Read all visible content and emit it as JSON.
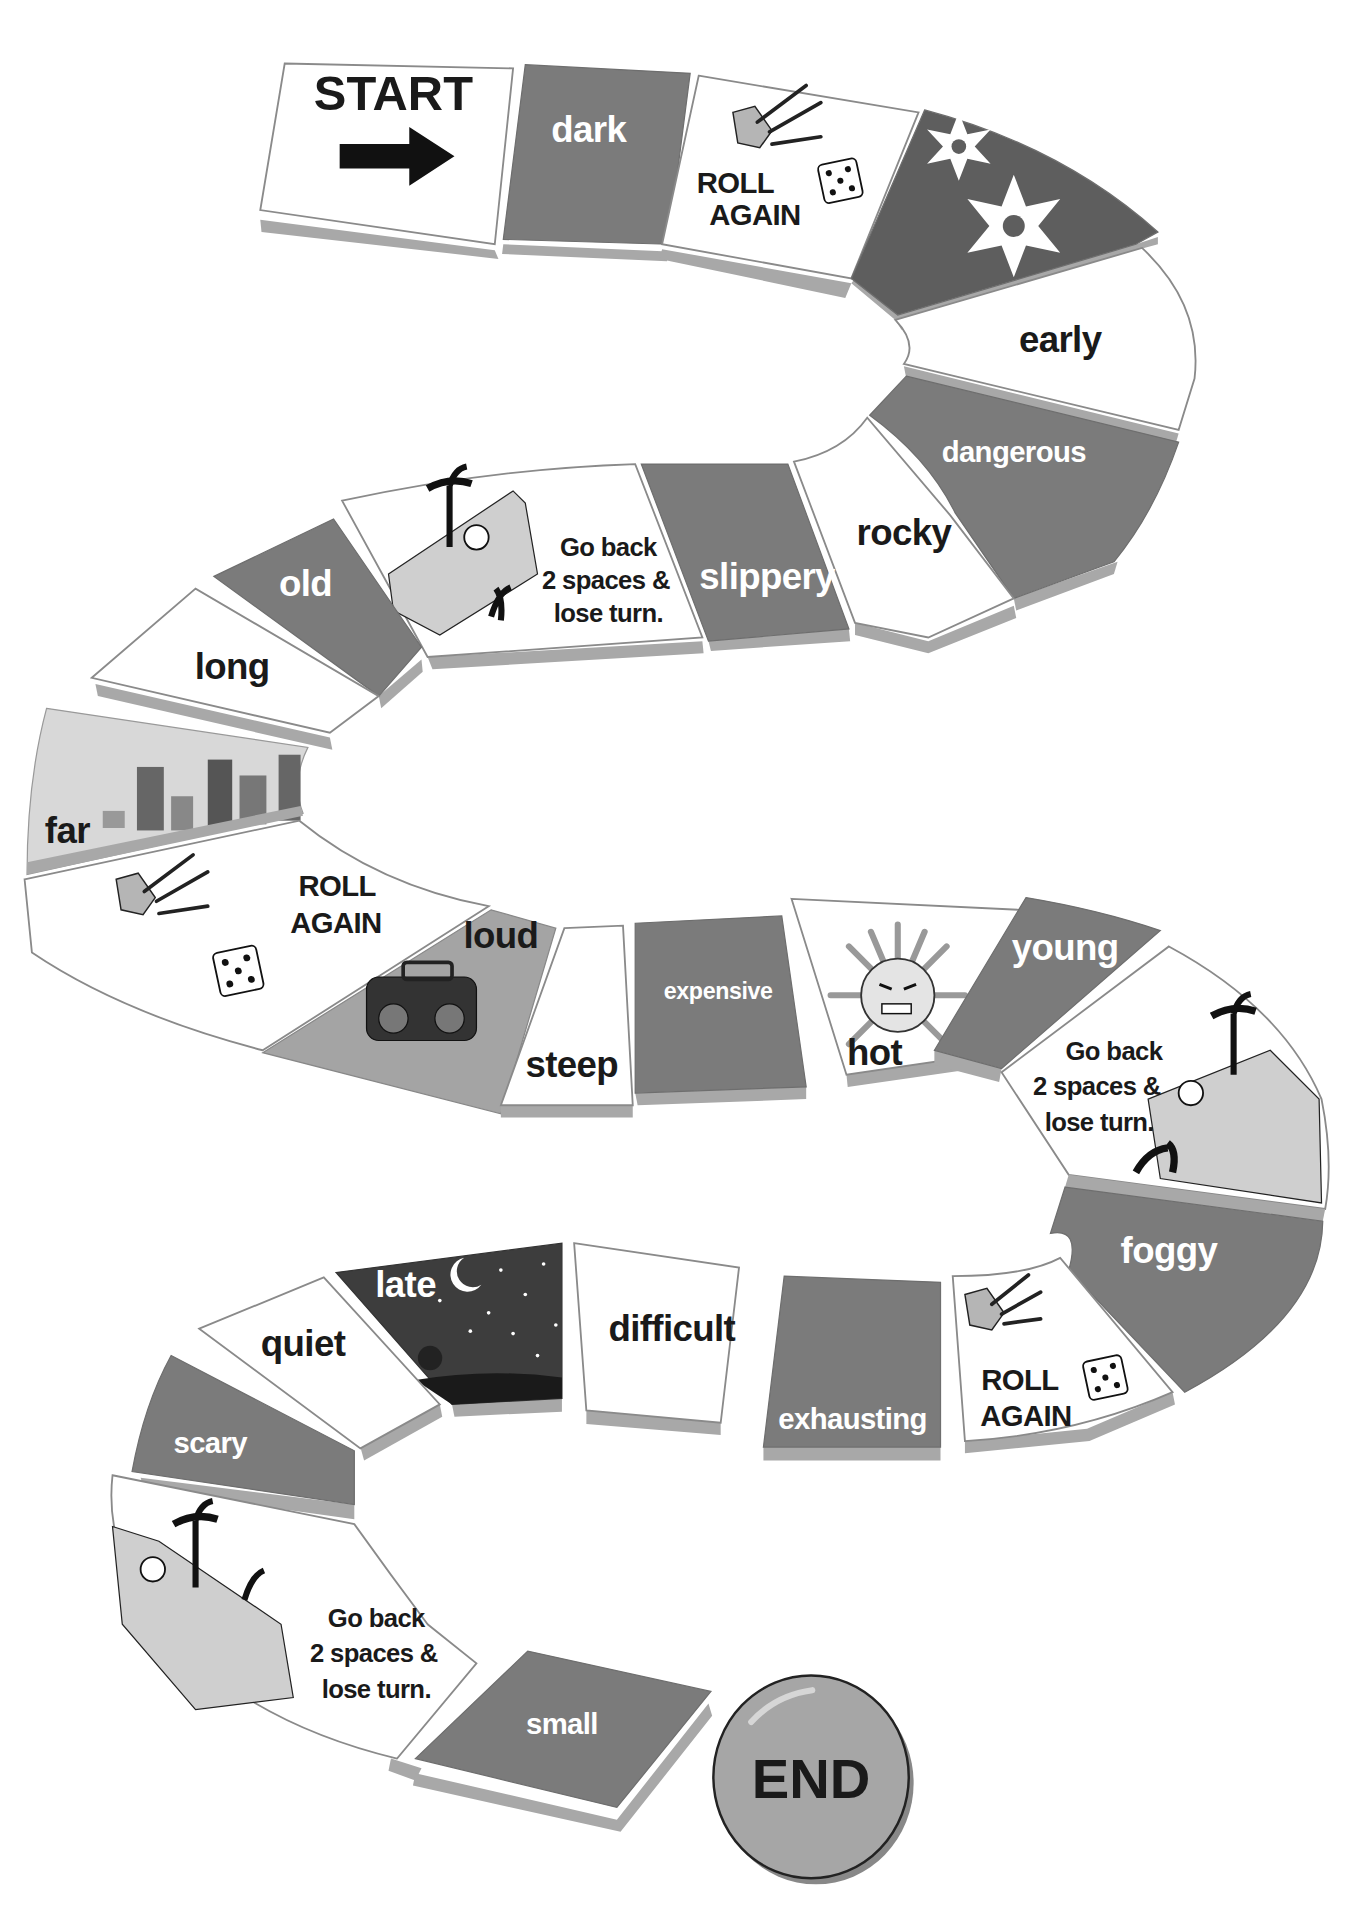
{
  "board": {
    "title": "Adjective board game",
    "colors": {
      "dark_tile": "#7b7b7b",
      "light_tile": "#ffffff",
      "shadow": "#a8a8a8",
      "night_tile": "#3d3d3d",
      "end_button": "#a6a6a6"
    },
    "start": {
      "label": "START",
      "icon": "arrow-right-icon"
    },
    "end": {
      "label": "END"
    },
    "tiles": [
      {
        "label": "dark",
        "style": "dark"
      },
      {
        "line1": "ROLL",
        "line2": "AGAIN",
        "style": "light",
        "icon": "hand-rolling-dice-icon"
      },
      {
        "label": "",
        "style": "dark",
        "icon": "snowflake-icon"
      },
      {
        "label": "early",
        "style": "light"
      },
      {
        "label": "dangerous",
        "style": "dark"
      },
      {
        "label": "rocky",
        "style": "light"
      },
      {
        "label": "slippery",
        "style": "dark"
      },
      {
        "line1": "Go back",
        "line2": "2 spaces &",
        "line3": "lose turn.",
        "style": "light",
        "icon": "falling-explorer-icon"
      },
      {
        "label": "old",
        "style": "dark"
      },
      {
        "label": "long",
        "style": "light"
      },
      {
        "label": "far",
        "style": "sky",
        "icon": "city-skyline-icon"
      },
      {
        "line1": "ROLL",
        "line2": "AGAIN",
        "style": "light",
        "icon": "hand-rolling-dice-icon"
      },
      {
        "label": "loud",
        "style": "loud",
        "icon": "boombox-icon"
      },
      {
        "label": "steep",
        "style": "light"
      },
      {
        "label": "expensive",
        "style": "dark"
      },
      {
        "label": "hot",
        "style": "light",
        "icon": "angry-sun-icon"
      },
      {
        "label": "young",
        "style": "dark"
      },
      {
        "line1": "Go back",
        "line2": "2 spaces &",
        "line3": "lose turn.",
        "style": "light",
        "icon": "falling-explorer-icon"
      },
      {
        "label": "foggy",
        "style": "dark"
      },
      {
        "line1": "ROLL",
        "line2": "AGAIN",
        "style": "light",
        "icon": "hand-rolling-dice-icon"
      },
      {
        "label": "exhausting",
        "style": "dark"
      },
      {
        "label": "difficult",
        "style": "light"
      },
      {
        "label": "late",
        "style": "night",
        "icon": "night-sky-moon-icon"
      },
      {
        "label": "quiet",
        "style": "light"
      },
      {
        "label": "scary",
        "style": "dark"
      },
      {
        "line1": "Go back",
        "line2": "2 spaces &",
        "line3": "lose turn.",
        "style": "light",
        "icon": "falling-explorer-icon"
      },
      {
        "label": "small",
        "style": "dark"
      }
    ]
  }
}
